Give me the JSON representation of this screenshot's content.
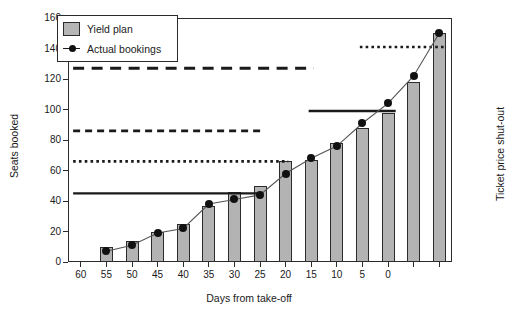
{
  "chart_data": {
    "type": "bar",
    "title": "",
    "xlabel": "Days from take-off",
    "ylabel": "Seats booked",
    "ylabel_right": "Ticket price shut-out",
    "xlim": [
      62.5,
      -12.5
    ],
    "ylim": [
      0,
      160
    ],
    "yticks": [
      0,
      20,
      40,
      60,
      80,
      100,
      120,
      140,
      160
    ],
    "xticks": [
      60,
      55,
      50,
      45,
      40,
      35,
      30,
      25,
      20,
      15,
      10,
      5,
      0,
      -5,
      -10
    ],
    "xtick_labels": [
      "60",
      "55",
      "50",
      "45",
      "40",
      "35",
      "30",
      "25",
      "20",
      "15",
      "10",
      "5",
      "0",
      "",
      ""
    ],
    "grid": false,
    "legend_position": "upper-left",
    "legend": [
      {
        "label": "Yield plan",
        "marker": "filled-square",
        "color": "#b3b3b3"
      },
      {
        "label": "Actual bookings",
        "marker": "line-with-dot",
        "color": "#111111"
      }
    ],
    "categories": [
      55,
      50,
      45,
      40,
      35,
      30,
      25,
      20,
      15,
      10,
      5,
      0,
      -5,
      -10
    ],
    "series": [
      {
        "name": "Yield plan",
        "type": "bar",
        "values": [
          10,
          14,
          20,
          25,
          37,
          46,
          50,
          66,
          67,
          78,
          88,
          98,
          118,
          150
        ]
      },
      {
        "name": "Actual bookings",
        "type": "line",
        "values": [
          7,
          11,
          19,
          22,
          38,
          41,
          44,
          58,
          68,
          76,
          91,
          104,
          122,
          150
        ]
      }
    ],
    "shutout_levels": [
      {
        "value": 45,
        "x_start": 61.5,
        "x_end": 25.5,
        "style": "solid"
      },
      {
        "value": 66,
        "x_start": 61.5,
        "x_end": 19.5,
        "style": "dotted"
      },
      {
        "value": 86,
        "x_start": 61.5,
        "x_end": 24.5,
        "style": "dashed"
      },
      {
        "value": 99,
        "x_start": 15.5,
        "x_end": -1.5,
        "style": "solid"
      },
      {
        "value": 127,
        "x_start": 61.5,
        "x_end": 14.5,
        "style": "longdash"
      },
      {
        "value": 141,
        "x_start": 5.5,
        "x_end": -11.5,
        "style": "dotted"
      }
    ],
    "colors": {
      "bar_fill": "#b3b3b3",
      "bar_edge": "#2b2b2b",
      "line": "#555555",
      "marker": "#111111",
      "axis": "#2b2b2b",
      "text": "#1a1a1a"
    }
  }
}
